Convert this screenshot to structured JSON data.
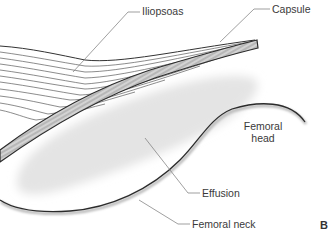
{
  "figure": {
    "panel_letter": "B",
    "labels": {
      "iliopsoas": "Iliopsoas",
      "capsule": "Capsule",
      "femoral_head_line1": "Femoral",
      "femoral_head_line2": "head",
      "effusion": "Effusion",
      "femoral_neck": "Femoral neck"
    },
    "colors": {
      "outline": "#2b2b2b",
      "fiber": "#555555",
      "leader": "#777777",
      "capsule_fill": "#bdbdbd",
      "effusion_fill": "#e6e6e6",
      "text": "#3a3a3a"
    }
  }
}
